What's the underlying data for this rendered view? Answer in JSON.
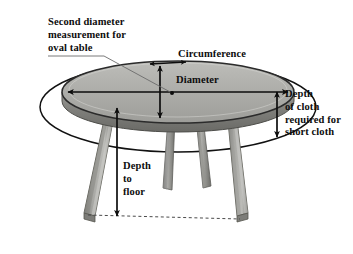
{
  "diagram": {
    "labels": {
      "second_diameter": "Second diameter\nmeasurement for\noval table",
      "circumference": "Circumference",
      "diameter": "Diameter",
      "depth_of_cloth": "Depth\nof cloth\nrequired for\nshort cloth",
      "depth_to_floor": "Depth\nto\nfloor"
    },
    "colors": {
      "background": "#ffffff",
      "ink": "#0d0d0d",
      "table_top": "#a8a8a4",
      "table_top_light": "#c9c9c5",
      "table_edge": "#8d8d89",
      "table_edge_dark": "#6e6e6a",
      "leg_face": "#9a9a96",
      "leg_shadow": "#6f6f6b",
      "leg_light": "#c2c2be",
      "leader_line": "#6b6b6b"
    },
    "measurements": [
      {
        "name": "circumference",
        "label": "Circumference",
        "kind": "arc-segment",
        "arrow": "double"
      },
      {
        "name": "diameter",
        "label": "Diameter",
        "kind": "horizontal-span",
        "arrow": "double"
      },
      {
        "name": "second-diameter",
        "label": "Second diameter measurement for oval table",
        "kind": "vertical-span",
        "arrow": "double"
      },
      {
        "name": "depth-of-cloth",
        "label": "Depth of cloth required for short cloth",
        "kind": "vertical-span",
        "arrow": "double"
      },
      {
        "name": "depth-to-floor",
        "label": "Depth to floor",
        "kind": "vertical-span",
        "arrow": "single-down"
      }
    ]
  }
}
